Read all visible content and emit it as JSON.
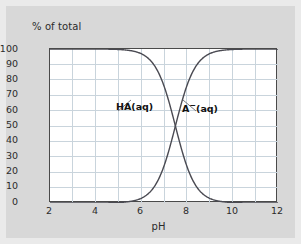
{
  "figure": {
    "background_color": "#d8d8d8",
    "frame_color": "#eaeaea",
    "plot_background": "#ffffff",
    "axis_color": "#4a4a4a",
    "grid_color": "#c9d4dc",
    "curve_color": "#4a4a52"
  },
  "axes": {
    "ylabel": "% of total",
    "xlabel": "pH",
    "y_ticks": [
      "100",
      "90",
      "80",
      "70",
      "60",
      "50",
      "40",
      "30",
      "20",
      "10",
      "0"
    ],
    "x_ticks": [
      "2",
      "4",
      "6",
      "8",
      "10",
      "12"
    ]
  },
  "annotations": {
    "ha_label": "HA(aq)",
    "a_label_base": "A",
    "a_label_charge": "−",
    "a_label_state": "(aq)"
  },
  "chart_data": {
    "type": "line",
    "title": "",
    "xlabel": "pH",
    "ylabel": "% of total",
    "xlim": [
      2,
      12
    ],
    "ylim": [
      0,
      100
    ],
    "grid": true,
    "grid_x_step": 1,
    "grid_y_step": 10,
    "x_tick_step": 2,
    "y_tick_step": 10,
    "legend": "inline-annotations",
    "pKa": 7.5,
    "crossing_point": {
      "pH": 7.5,
      "percent": 50
    },
    "x": [
      2.0,
      2.5,
      3.0,
      3.5,
      4.0,
      4.5,
      5.0,
      5.5,
      6.0,
      6.5,
      7.0,
      7.25,
      7.5,
      7.75,
      8.0,
      8.5,
      9.0,
      9.5,
      10.0,
      10.5,
      11.0,
      11.5,
      12.0
    ],
    "series": [
      {
        "name": "HA(aq)",
        "values": [
          100.0,
          100.0,
          100.0,
          100.0,
          100.0,
          99.9,
          99.7,
          99.0,
          96.9,
          90.9,
          76.0,
          64.0,
          50.0,
          36.0,
          24.0,
          9.1,
          3.1,
          1.0,
          0.3,
          0.1,
          0.0,
          0.0,
          0.0
        ]
      },
      {
        "name": "A−(aq)",
        "values": [
          0.0,
          0.0,
          0.0,
          0.0,
          0.0,
          0.1,
          0.3,
          1.0,
          3.1,
          9.1,
          24.0,
          36.0,
          50.0,
          64.0,
          76.0,
          90.9,
          96.9,
          99.0,
          99.7,
          99.9,
          100.0,
          100.0,
          100.0
        ]
      }
    ]
  }
}
